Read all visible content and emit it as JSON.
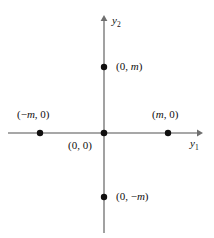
{
  "figure": {
    "type": "cartesian-coordinate-diagram",
    "width": 214,
    "height": 238,
    "background_color": "#ffffff",
    "axis_color": "#8a8a8a",
    "point_color": "#100f0f",
    "text_color": "#100f0f"
  },
  "axes": {
    "horizontal": {
      "name": "y1",
      "label_prefix": "y",
      "label_subscript": "1",
      "x_start": 8,
      "x_end": 200,
      "y": 133,
      "arrow": "right"
    },
    "vertical": {
      "name": "y2",
      "label_prefix": "y",
      "label_subscript": "2",
      "y_start": 18,
      "y_end": 233,
      "x": 104,
      "arrow": "up"
    }
  },
  "points": [
    {
      "id": "origin",
      "label_open": "(0, 0)",
      "coord_x": "0",
      "coord_y": "0",
      "px": 104,
      "py": 133
    },
    {
      "id": "neg-m-0",
      "label_prefix": "(−",
      "label_var": "m",
      "label_suffix": ", 0)",
      "px": 40,
      "py": 133
    },
    {
      "id": "m-0",
      "label_prefix": "(",
      "label_var": "m",
      "label_suffix": ", 0)",
      "px": 168,
      "py": 133
    },
    {
      "id": "0-m",
      "label_prefix": "(0, ",
      "label_var": "m",
      "label_suffix": ")",
      "px": 104,
      "py": 67
    },
    {
      "id": "0-neg-m",
      "label_prefix": "(0, −",
      "label_var": "m",
      "label_suffix": ")",
      "px": 104,
      "py": 197
    }
  ]
}
